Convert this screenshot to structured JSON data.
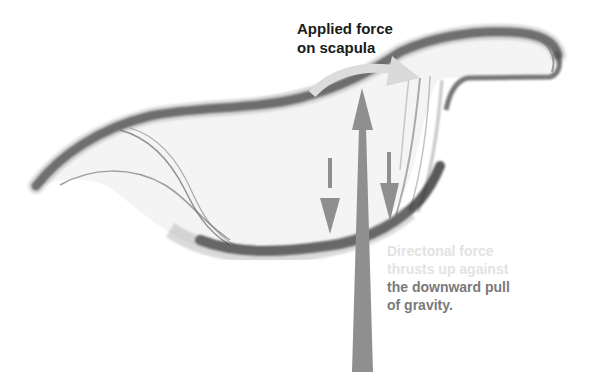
{
  "diagram": {
    "labels": {
      "applied_force": [
        "Applied force",
        "on scapula"
      ],
      "note_faded": [
        "Directonal force",
        "thrusts up against"
      ],
      "note_dark": [
        "the downward pull",
        "of gravity."
      ]
    },
    "arrows": [
      {
        "name": "curved-applied-force-arrow",
        "direction": "right",
        "color": "#dcdcdc"
      },
      {
        "name": "upward-force-arrow",
        "direction": "up",
        "color": "#8f8f8f"
      },
      {
        "name": "gravity-arrow-left",
        "direction": "down",
        "color": "#8f8f8f"
      },
      {
        "name": "gravity-arrow-right",
        "direction": "down",
        "color": "#8f8f8f"
      }
    ],
    "colors": {
      "sketch_dark": "#3a3a3a",
      "sketch_mid": "#8a8a8a",
      "arrow_gray": "#8f8f8f",
      "curved_arrow": "#dcdcdc",
      "text_dark": "#1a1a1a",
      "text_faded": "#e3e3e3",
      "text_gray": "#7a7a7a"
    }
  }
}
